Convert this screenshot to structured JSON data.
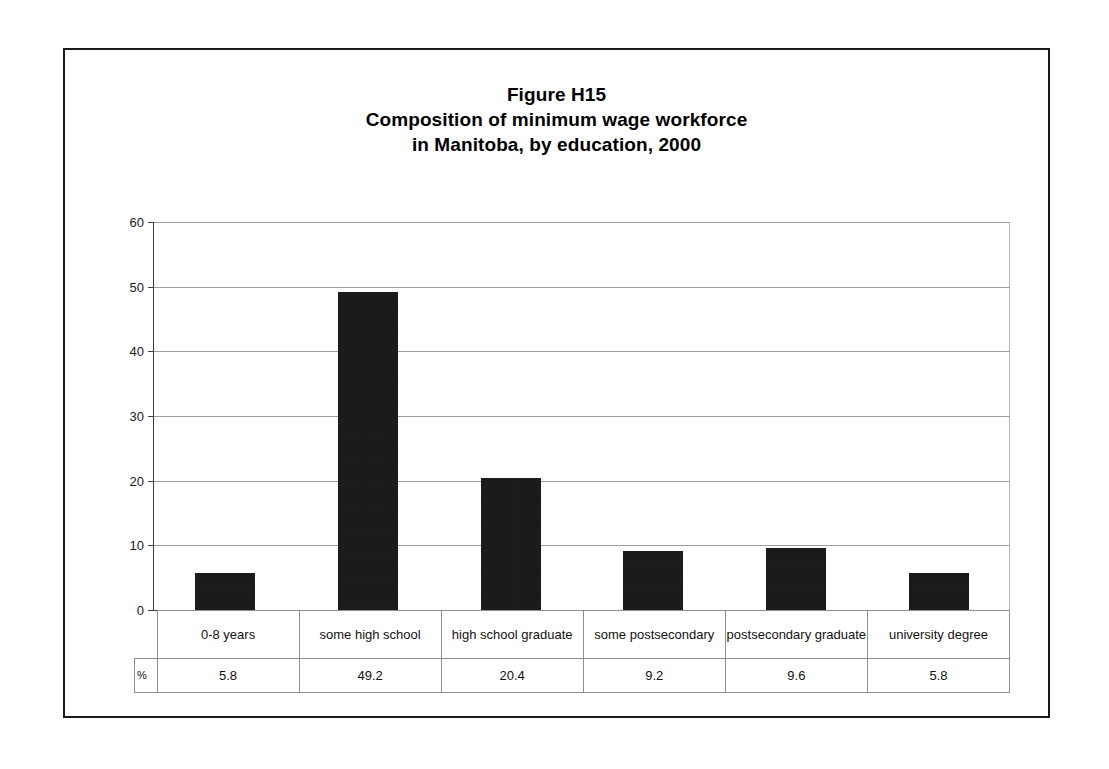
{
  "figure": {
    "title_line1": "Figure H15",
    "title_line2": "Composition of minimum wage workforce",
    "title_line3": "in Manitoba, by education, 2000",
    "unit_stub": "%",
    "frame_color": "#1a1a1a",
    "bar_color": "#111111",
    "grid_color": "#9d9d9d"
  },
  "axis": {
    "y_ticks": [
      "0",
      "10",
      "20",
      "30",
      "40",
      "50",
      "60"
    ]
  },
  "table": {
    "categories": [
      "0-8 years",
      "some high school",
      "high school graduate",
      "some postsecondary",
      "postsecondary graduate",
      "university degree"
    ],
    "values": [
      "5.8",
      "49.2",
      "20.4",
      "9.2",
      "9.6",
      "5.8"
    ]
  },
  "chart_data": {
    "type": "bar",
    "categories": [
      "0-8 years",
      "some high school",
      "high school graduate",
      "some postsecondary",
      "postsecondary graduate",
      "university degree"
    ],
    "values": [
      5.8,
      49.2,
      20.4,
      9.2,
      9.6,
      5.8
    ],
    "xlabel": "",
    "ylabel": "",
    "ylim": [
      0,
      60
    ],
    "ytick_step": 10,
    "grid": true,
    "legend": false,
    "series_unit": "%"
  }
}
